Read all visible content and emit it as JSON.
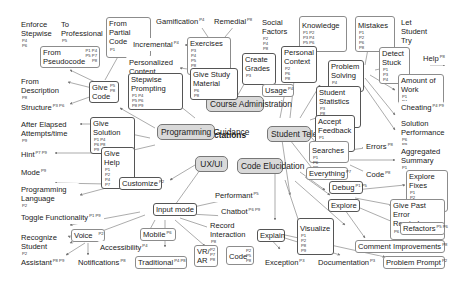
{
  "title": "Expectations",
  "hubs": {
    "programming_guidance": {
      "label": "Programming Guidance"
    },
    "course_administration": {
      "label": "Course Administration"
    },
    "student_telemetry": {
      "label": "Student Telemetry"
    },
    "ux_ui": {
      "label": "UX/UI"
    },
    "code_elucidation": {
      "label": "Code Elucidation"
    }
  },
  "nodes": {
    "enforce_stepwise": {
      "label": "Enforce Stepwise",
      "tags": "P4 P6"
    },
    "to_professional": {
      "label": "To Professional",
      "tags": "P5"
    },
    "from_partial_code": {
      "label": "From Partial Code",
      "tags": "P1"
    },
    "from_pseudocode": {
      "label": "From Pseudocode",
      "tags": "P1 P4 P5 P7 P8"
    },
    "from_description": {
      "label": "From Description",
      "tags": "P8"
    },
    "give_code": {
      "label": "Give Code",
      "tags": "P5 P8"
    },
    "structure": {
      "label": "Structure",
      "tags": "P3 P6"
    },
    "after_elapsed": {
      "label": "After Elapsed Attempts/time",
      "tags": "P9"
    },
    "give_solution": {
      "label": "Give Solution",
      "tags": "P1 P4 P6 P8 P9"
    },
    "hint": {
      "label": "Hint",
      "tags": "P7 P9"
    },
    "give_help": {
      "label": "Give Help",
      "tags": "P1 P2 P4 P7"
    },
    "gamification": {
      "label": "Gamification",
      "tags": "P4"
    },
    "remedial": {
      "label": "Remedial",
      "tags": "P8"
    },
    "incremental": {
      "label": "Incremental",
      "tags": "P4"
    },
    "exercises": {
      "label": "Exercises",
      "tags": "P3 P4 P5 P8 P9"
    },
    "personalized_content": {
      "label": "Personalized Content",
      "tags": "P6 P7"
    },
    "give_study_material": {
      "label": "Give Study Material",
      "tags": "P6 P8"
    },
    "stepwise_prompting": {
      "label": "Stepwise Prompting",
      "tags": "P1 P4 P5 P6 P8 P9"
    },
    "create_grades": {
      "label": "Create Grades",
      "tags": "P3"
    },
    "social_factors": {
      "label": "Social Factors",
      "tags": "P2 P4 P8"
    },
    "knowledge": {
      "label": "Knowledge",
      "tags": "P1 P2 P3 P4 P5 P6 P8"
    },
    "mistakes": {
      "label": "Mistakes",
      "tags": "P1 P2 P6 P8"
    },
    "let_student_try": {
      "label": "Let Student Try",
      "tags": "P1 P7"
    },
    "personal_context": {
      "label": "Personal Context",
      "tags": "P2 P6 P8"
    },
    "problem_solving": {
      "label": "Problem Solving",
      "tags": "P4 P5"
    },
    "detect_stuck": {
      "label": "Detect Stuck",
      "tags": "P1 P3 P4"
    },
    "help": {
      "label": "Help",
      "tags": "P8"
    },
    "usage": {
      "label": "Usage",
      "tags": "P4"
    },
    "student_statistics": {
      "label": "Student Statistics",
      "tags": "P3 P8 P5 P7"
    },
    "amount_of_work": {
      "label": "Amount of Work",
      "tags": "P1 P4 P9"
    },
    "cheating": {
      "label": "Cheating",
      "tags": "P4 P9"
    },
    "accept_feedback": {
      "label": "Accept Feedback",
      "tags": "P1 P3 P4"
    },
    "solution_performance": {
      "label": "Solution Performance",
      "tags": "P6 P9"
    },
    "searches": {
      "label": "Searches",
      "tags": "P1 P6 P8"
    },
    "errors": {
      "label": "Errors",
      "tags": "P8"
    },
    "aggregated_summary": {
      "label": "Aggregated Summary",
      "tags": "P1"
    },
    "everything": {
      "label": "Everything",
      "tags": "P7"
    },
    "code_search": {
      "label": "Code",
      "tags": "P8"
    },
    "mode": {
      "label": "Mode",
      "tags": "P9"
    },
    "customize": {
      "label": "Customize",
      "tags": "P2"
    },
    "programming_language": {
      "label": "Programming Language",
      "tags": "P2"
    },
    "toggle_functionality": {
      "label": "Toggle Functionality",
      "tags": "P1 P9"
    },
    "input_mode": {
      "label": "Input mode",
      "tags": ""
    },
    "performant": {
      "label": "Performant",
      "tags": "P5"
    },
    "chatbot": {
      "label": "Chatbot",
      "tags": "P6 P9"
    },
    "record_interaction": {
      "label": "Record Interaction",
      "tags": "P8"
    },
    "recognize_student": {
      "label": "Recognize Student",
      "tags": "P2"
    },
    "voice": {
      "label": "Voice",
      "tags": "P2"
    },
    "accessibility": {
      "label": "Accessibility",
      "tags": "P4"
    },
    "mobile": {
      "label": "Mobile",
      "tags": "P6"
    },
    "assistant": {
      "label": "Assistant",
      "tags": "P8 P9"
    },
    "notifications": {
      "label": "Notifications",
      "tags": "P8"
    },
    "traditional": {
      "label": "Traditional",
      "tags": "P4 P8"
    },
    "vr_ar": {
      "label": "VR/ AR",
      "tags": "P2 P7 P8"
    },
    "code_explain": {
      "label": "Code",
      "tags": "P2 P5 P8"
    },
    "debug": {
      "label": "Debug",
      "tags": "P1 P5"
    },
    "explore_fixes": {
      "label": "Explore Fixes",
      "tags": "P1 P2 P8 P9"
    },
    "explore": {
      "label": "Explore",
      "tags": ""
    },
    "give_past_error": {
      "label": "Give Past Error Reminders",
      "tags": "P6"
    },
    "refactors": {
      "label": "Refactors",
      "tags": "P5 P6"
    },
    "visualize": {
      "label": "Visualize",
      "tags": "P1 P2 P8 P9"
    },
    "explain": {
      "label": "Explain",
      "tags": ""
    },
    "comment_improvements": {
      "label": "Comment Improvements",
      "tags": "P8"
    },
    "exception": {
      "label": "Exception",
      "tags": "P3"
    },
    "documentation": {
      "label": "Documentation",
      "tags": "P3"
    },
    "problem_prompt": {
      "label": "Problem Prompt",
      "tags": "P2"
    }
  },
  "colors": {
    "edge": "#777777",
    "hub_fill": "#d9d9d9",
    "border": "#8c8c8c"
  }
}
